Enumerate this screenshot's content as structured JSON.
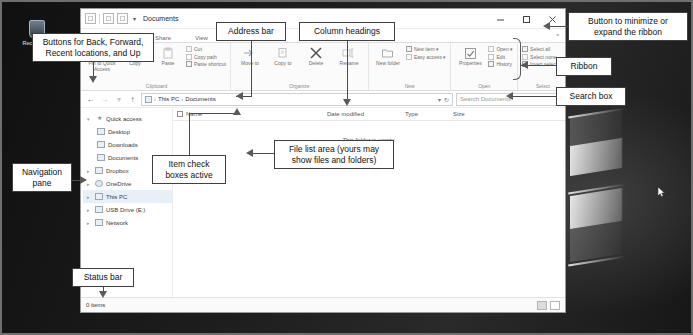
{
  "desktop": {
    "recycle_bin_label": "Recycle Bin"
  },
  "window": {
    "title": "Documents",
    "quick_access_caret": "▾",
    "controls": {
      "minimize": "minimize-button",
      "maximize": "maximize-button",
      "close": "close-button"
    },
    "ribbon_toggle": "^"
  },
  "tabs": [
    {
      "label": "Share"
    },
    {
      "label": "View"
    }
  ],
  "ribbon": {
    "groups": [
      {
        "label": "Clipboard",
        "big_buttons": [
          {
            "label": "Pin to Quick\nAccess",
            "icon": "pin-icon"
          },
          {
            "label": "Copy",
            "icon": "copy-icon"
          },
          {
            "label": "Paste",
            "icon": "paste-icon"
          }
        ],
        "small_buttons": [
          {
            "label": "Cut",
            "icon": "scissors-icon"
          },
          {
            "label": "Copy path",
            "icon": "copy-path-icon"
          },
          {
            "label": "Paste shortcut",
            "icon": "paste-shortcut-icon"
          }
        ]
      },
      {
        "label": "Organize",
        "big_buttons": [
          {
            "label": "Move\nto",
            "icon": "move-to-icon"
          },
          {
            "label": "Copy\nto",
            "icon": "copy-to-icon"
          },
          {
            "label": "Delete",
            "icon": "delete-icon"
          },
          {
            "label": "Rename",
            "icon": "rename-icon"
          }
        ],
        "small_buttons": []
      },
      {
        "label": "New",
        "big_buttons": [
          {
            "label": "New\nfolder",
            "icon": "new-folder-icon"
          }
        ],
        "small_buttons": [
          {
            "label": "New item ▾",
            "icon": "new-item-icon"
          },
          {
            "label": "Easy access ▾",
            "icon": "easy-access-icon"
          }
        ]
      },
      {
        "label": "Open",
        "big_buttons": [
          {
            "label": "Properties",
            "icon": "properties-icon"
          }
        ],
        "small_buttons": [
          {
            "label": "Open ▾",
            "icon": "open-icon"
          },
          {
            "label": "Edit",
            "icon": "edit-icon"
          },
          {
            "label": "History",
            "icon": "history-icon"
          }
        ]
      },
      {
        "label": "Select",
        "big_buttons": [],
        "small_buttons": [
          {
            "label": "Select all",
            "icon": "select-all-icon"
          },
          {
            "label": "Select none",
            "icon": "select-none-icon"
          },
          {
            "label": "Invert selection",
            "icon": "invert-selection-icon"
          }
        ]
      }
    ]
  },
  "address": {
    "back": "←",
    "forward": "→",
    "recent": "▾",
    "up": "↑",
    "crumbs": [
      "This PC",
      "Documents"
    ],
    "crumb_sep": "›",
    "dropdown_caret": "▾",
    "refresh": "↻"
  },
  "search": {
    "placeholder": "Search Documents",
    "value": ""
  },
  "navpane": {
    "items": [
      {
        "label": "Quick access",
        "icon": "star-icon",
        "indent": false,
        "expanded": true,
        "selected": false
      },
      {
        "label": "Desktop",
        "icon": "desktop-icon",
        "indent": true,
        "expanded": false,
        "selected": false
      },
      {
        "label": "Downloads",
        "icon": "downloads-icon",
        "indent": true,
        "expanded": false,
        "selected": false
      },
      {
        "label": "Documents",
        "icon": "documents-icon",
        "indent": true,
        "expanded": false,
        "selected": false
      },
      {
        "label": "Dropbox",
        "icon": "dropbox-icon",
        "indent": false,
        "expanded": false,
        "selected": false
      },
      {
        "label": "OneDrive",
        "icon": "onedrive-cloud-icon",
        "indent": false,
        "expanded": false,
        "selected": false
      },
      {
        "label": "This PC",
        "icon": "this-pc-icon",
        "indent": false,
        "expanded": false,
        "selected": true
      },
      {
        "label": "USB Drive (E:)",
        "icon": "usb-drive-icon",
        "indent": false,
        "expanded": false,
        "selected": false
      },
      {
        "label": "Network",
        "icon": "network-icon",
        "indent": false,
        "expanded": false,
        "selected": false
      }
    ]
  },
  "filelist": {
    "columns": [
      "Name",
      "Date modified",
      "Type",
      "Size"
    ],
    "empty_message": "This folder is empty.",
    "rows": []
  },
  "statusbar": {
    "item_count": "0 items",
    "views": [
      {
        "name": "details-view-button",
        "active": true
      },
      {
        "name": "large-icons-view-button",
        "active": false
      }
    ]
  },
  "callouts": {
    "back_forward": "Buttons for Back, Forward,\nRecent locations, and Up",
    "address_bar": "Address bar",
    "column_headings": "Column headings",
    "ribbon_toggle": "Button to minimize or\nexpand the ribbon",
    "ribbon": "Ribbon",
    "search_box": "Search box",
    "navigation_pane": "Navigation\npane",
    "item_check_boxes": "Item check\nboxes active",
    "file_list_area": "File list area (yours may\nshow files and folders)",
    "status_bar": "Status bar"
  }
}
